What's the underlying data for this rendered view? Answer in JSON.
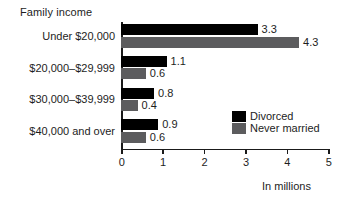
{
  "chart_data": {
    "type": "bar",
    "orientation": "horizontal",
    "title": "Family income",
    "xlabel": "In millions",
    "ylabel": "",
    "xlim": [
      0,
      5
    ],
    "xticks": [
      "0",
      "1",
      "2",
      "3",
      "4",
      "5"
    ],
    "grid": false,
    "legend_position": "inside-right",
    "categories": [
      "Under $20,000",
      "$20,000–$29,999",
      "$30,000–$39,999",
      "$40,000 and over"
    ],
    "series": [
      {
        "name": "Divorced",
        "color": "#000000",
        "values": [
          3.3,
          1.1,
          0.8,
          0.9
        ],
        "value_labels": [
          "3.3",
          "1.1",
          "0.8",
          "0.9"
        ]
      },
      {
        "name": "Never married",
        "color": "#5c5c5e",
        "values": [
          4.3,
          0.6,
          0.4,
          0.6
        ],
        "value_labels": [
          "4.3",
          "0.6",
          "0.4",
          "0.6"
        ]
      }
    ]
  },
  "legend": {
    "items": [
      {
        "label": "Divorced",
        "color": "#000000"
      },
      {
        "label": "Never married",
        "color": "#5c5c5e"
      }
    ]
  },
  "colors": {
    "divorced": "#000000",
    "never_married": "#5c5c5e",
    "axis": "#1a1a1a",
    "text": "#1d1d1d",
    "background": "#ffffff"
  }
}
